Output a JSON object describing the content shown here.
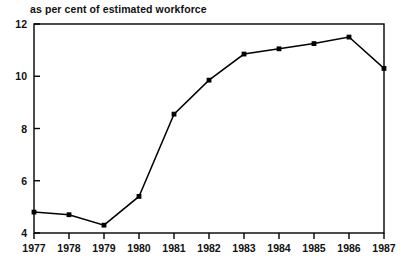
{
  "chart_data": {
    "type": "line",
    "title": "as per cent of estimated workforce",
    "xlabel": "",
    "ylabel": "",
    "categories": [
      "1977",
      "1978",
      "1979",
      "1980",
      "1981",
      "1982",
      "1983",
      "1984",
      "1985",
      "1986",
      "1987"
    ],
    "values": [
      4.8,
      4.7,
      4.3,
      5.4,
      8.55,
      9.85,
      10.85,
      11.05,
      11.25,
      11.5,
      10.3
    ],
    "series": [
      {
        "name": "unemployment",
        "values": [
          4.8,
          4.7,
          4.3,
          5.4,
          8.55,
          9.85,
          10.85,
          11.05,
          11.25,
          11.5,
          10.3
        ]
      }
    ],
    "ylim": [
      4,
      12
    ],
    "y_ticks": [
      4,
      6,
      8,
      10,
      12
    ],
    "y_tick_labels": [
      "4",
      "6",
      "8",
      "10",
      "12"
    ],
    "x_tick_labels": [
      "1977",
      "1978",
      "1979",
      "1980",
      "1981",
      "1982",
      "1983",
      "1984",
      "1985",
      "1986",
      "1987"
    ],
    "grid": false,
    "legend": null,
    "marker": "square",
    "line_color": "#000000",
    "marker_color": "#000000",
    "frame_color": "#000000",
    "background_color": "#ffffff"
  }
}
